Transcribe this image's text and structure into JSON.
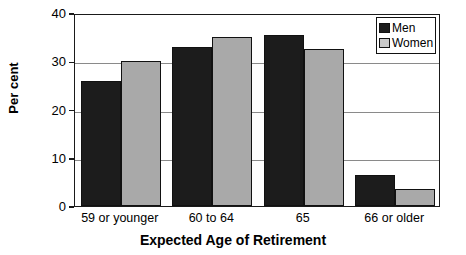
{
  "chart_data": {
    "type": "bar",
    "title": "",
    "xlabel": "Expected Age of Retirement",
    "ylabel": "Per cent",
    "categories": [
      "59 or younger",
      "60 to 64",
      "65",
      "66 or older"
    ],
    "series": [
      {
        "name": "Men",
        "values": [
          26,
          33,
          35.5,
          6.5
        ],
        "color": "#1c1c1c"
      },
      {
        "name": "Women",
        "values": [
          30,
          35,
          32.5,
          3.5
        ],
        "color": "#a9a9a9"
      }
    ],
    "ylim": [
      0,
      40
    ],
    "yticks": [
      0,
      10,
      20,
      30,
      40
    ],
    "ytick_labels": [
      "0",
      "10",
      "20",
      "30",
      "40"
    ],
    "grid": true,
    "grid_axis": "y",
    "legend_position": "top-right",
    "orientation": "vertical",
    "bar_mode": "grouped"
  },
  "axes": {
    "y_title": "Per cent",
    "x_title": "Expected Age of Retirement"
  },
  "legend": {
    "entries": [
      {
        "label": "Men",
        "swatch": "men-swatch"
      },
      {
        "label": "Women",
        "swatch": "women-swatch"
      }
    ]
  },
  "colors": {
    "men": "#1c1c1c",
    "women": "#a9a9a9",
    "axis": "#1a1a1a",
    "grid": "#8a8a8a",
    "background": "#ffffff"
  }
}
